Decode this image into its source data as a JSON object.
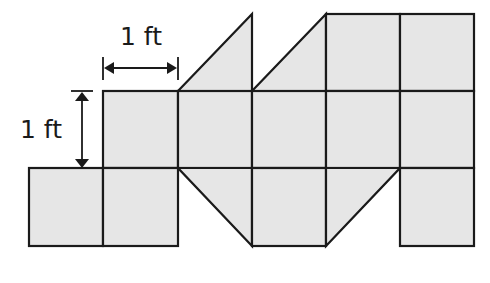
{
  "diagram": {
    "unit_labels": {
      "horizontal": "1 ft",
      "vertical": "1 ft"
    },
    "colors": {
      "fill": "#e6e6e6",
      "stroke": "#1a1a1a",
      "background": "#ffffff"
    },
    "grid": {
      "cell_size_ft": 1,
      "columns": 6,
      "rows": 3
    },
    "shapes": [
      {
        "type": "triangle",
        "row": 0,
        "col": 2,
        "orientation": "right-angle-bottom-right"
      },
      {
        "type": "triangle",
        "row": 0,
        "col": 3,
        "orientation": "right-angle-bottom-right"
      },
      {
        "type": "square",
        "row": 0,
        "col": 4
      },
      {
        "type": "square",
        "row": 0,
        "col": 5
      },
      {
        "type": "square",
        "row": 1,
        "col": 1
      },
      {
        "type": "square",
        "row": 1,
        "col": 2
      },
      {
        "type": "square",
        "row": 1,
        "col": 3
      },
      {
        "type": "square",
        "row": 1,
        "col": 4
      },
      {
        "type": "square",
        "row": 1,
        "col": 5
      },
      {
        "type": "square",
        "row": 2,
        "col": 0
      },
      {
        "type": "square",
        "row": 2,
        "col": 1
      },
      {
        "type": "triangle",
        "row": 2,
        "col": 2,
        "orientation": "right-angle-top-right"
      },
      {
        "type": "square",
        "row": 2,
        "col": 3
      },
      {
        "type": "triangle",
        "row": 2,
        "col": 4,
        "orientation": "right-angle-top-left"
      },
      {
        "type": "square",
        "row": 2,
        "col": 5
      }
    ],
    "counts": {
      "full_squares": 11,
      "half_square_triangles": 4
    }
  }
}
